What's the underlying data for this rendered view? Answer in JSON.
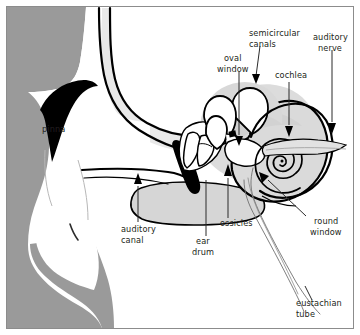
{
  "figure": {
    "kind": "anatomical-diagram",
    "background_color": "#ffffff",
    "head_fill_color": "#9a9a9a",
    "bone_fill_color": "#d9d9d9",
    "canal_fill_color": "#e8e8e8",
    "outline_color": "#000000",
    "border_color": "#8c8c8c",
    "text_color": "#231f20"
  },
  "labels": {
    "pinna": {
      "line1": "pinna",
      "line2": ""
    },
    "auditory_canal": {
      "line1": "auditory",
      "line2": "canal"
    },
    "ear_drum": {
      "line1": "ear",
      "line2": "drum"
    },
    "ossicles": {
      "line1": "ossicles",
      "line2": ""
    },
    "oval_window": {
      "line1": "oval",
      "line2": "window"
    },
    "semicircular_canals": {
      "line1": "semicircular",
      "line2": "canals"
    },
    "cochlea": {
      "line1": "cochlea",
      "line2": ""
    },
    "auditory_nerve": {
      "line1": "auditory",
      "line2": "nerve"
    },
    "round_window": {
      "line1": "round",
      "line2": "window"
    },
    "eustachian_tube": {
      "line1": "eustachian",
      "line2": "tube"
    }
  },
  "parts_list": [
    "pinna",
    "auditory canal",
    "ear drum",
    "ossicles",
    "oval window",
    "semicircular canals",
    "cochlea",
    "auditory nerve",
    "round window",
    "eustachian tube"
  ]
}
